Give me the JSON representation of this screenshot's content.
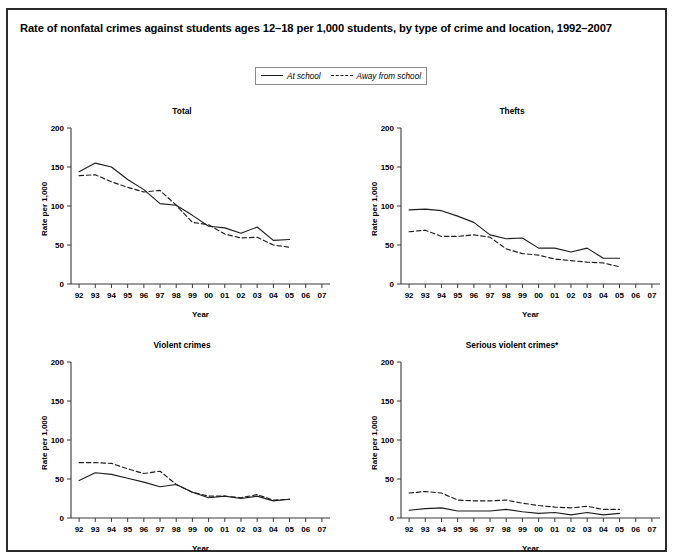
{
  "top_stub": "",
  "figure": {
    "title": "Rate of nonfatal crimes against students ages 12–18 per 1,000 students, by type of crime and location, 1992–2007",
    "footnote": ""
  },
  "legend": {
    "entries": [
      {
        "label": "At school",
        "style": "solid",
        "swatch_name": "solid-line-swatch"
      },
      {
        "label": "Away from school",
        "style": "dashed",
        "swatch_name": "dashed-line-swatch"
      }
    ]
  },
  "axes_common": {
    "ylabel": "Rate per 1,000",
    "xlabel": "Year",
    "yticks": [
      0,
      50,
      100,
      150,
      200
    ],
    "ylim": [
      0,
      200
    ],
    "xticks": [
      "92",
      "93",
      "94",
      "95",
      "96",
      "97",
      "98",
      "99",
      "00",
      "01",
      "02",
      "03",
      "04",
      "05",
      "06",
      "07"
    ]
  },
  "chart_data": [
    {
      "type": "line",
      "title": "Total",
      "xlabel": "Year",
      "ylabel": "Rate per 1,000",
      "ylim": [
        0,
        200
      ],
      "yticks": [
        0,
        50,
        100,
        150,
        200
      ],
      "grid": false,
      "legend_position": "top-center-shared",
      "x": [
        "92",
        "93",
        "94",
        "95",
        "96",
        "97",
        "98",
        "99",
        "00",
        "01",
        "02",
        "03",
        "04",
        "05"
      ],
      "series": [
        {
          "name": "At school",
          "style": "solid",
          "values": [
            144,
            155,
            150,
            134,
            121,
            103,
            101,
            88,
            74,
            72,
            65,
            73,
            56,
            57
          ]
        },
        {
          "name": "Away from school",
          "style": "dashed",
          "values": [
            139,
            140,
            131,
            124,
            118,
            120,
            101,
            79,
            76,
            64,
            59,
            60,
            50,
            47
          ]
        }
      ]
    },
    {
      "type": "line",
      "title": "Thefts",
      "xlabel": "Year",
      "ylabel": "Rate per 1,000",
      "ylim": [
        0,
        200
      ],
      "yticks": [
        0,
        50,
        100,
        150,
        200
      ],
      "grid": false,
      "legend_position": "top-center-shared",
      "x": [
        "92",
        "93",
        "94",
        "95",
        "96",
        "97",
        "98",
        "99",
        "00",
        "01",
        "02",
        "03",
        "04",
        "05"
      ],
      "series": [
        {
          "name": "At school",
          "style": "solid",
          "values": [
            95,
            96,
            94,
            87,
            79,
            63,
            58,
            59,
            46,
            46,
            41,
            46,
            33,
            33
          ]
        },
        {
          "name": "Away from school",
          "style": "dashed",
          "values": [
            67,
            69,
            61,
            61,
            63,
            60,
            45,
            39,
            37,
            32,
            30,
            28,
            27,
            22
          ]
        }
      ]
    },
    {
      "type": "line",
      "title": "Violent crimes",
      "xlabel": "Year",
      "ylabel": "Rate per 1,000",
      "ylim": [
        0,
        200
      ],
      "yticks": [
        0,
        50,
        100,
        150,
        200
      ],
      "grid": false,
      "legend_position": "top-center-shared",
      "x": [
        "92",
        "93",
        "94",
        "95",
        "96",
        "97",
        "98",
        "99",
        "00",
        "01",
        "02",
        "03",
        "04",
        "05"
      ],
      "series": [
        {
          "name": "At school",
          "style": "solid",
          "values": [
            48,
            58,
            56,
            51,
            46,
            40,
            43,
            33,
            26,
            28,
            25,
            28,
            22,
            24
          ]
        },
        {
          "name": "Away from school",
          "style": "dashed",
          "values": [
            71,
            71,
            70,
            63,
            57,
            60,
            43,
            33,
            28,
            28,
            26,
            30,
            23,
            24
          ]
        }
      ]
    },
    {
      "type": "line",
      "title": "Serious violent crimes*",
      "xlabel": "Year",
      "ylabel": "Rate per 1,000",
      "ylim": [
        0,
        200
      ],
      "yticks": [
        0,
        50,
        100,
        150,
        200
      ],
      "grid": false,
      "legend_position": "top-center-shared",
      "x": [
        "92",
        "93",
        "94",
        "95",
        "96",
        "97",
        "98",
        "99",
        "00",
        "01",
        "02",
        "03",
        "04",
        "05"
      ],
      "series": [
        {
          "name": "At school",
          "style": "solid",
          "values": [
            10,
            12,
            13,
            9,
            9,
            9,
            11,
            8,
            6,
            7,
            4,
            7,
            4,
            6
          ]
        },
        {
          "name": "Away from school",
          "style": "dashed",
          "values": [
            32,
            34,
            32,
            23,
            22,
            22,
            23,
            19,
            16,
            14,
            13,
            15,
            11,
            11
          ]
        }
      ]
    }
  ],
  "panels_layout": [
    {
      "left": 14,
      "top": 96,
      "width": 320,
      "height": 216
    },
    {
      "left": 344,
      "top": 96,
      "width": 320,
      "height": 216
    },
    {
      "left": 14,
      "top": 330,
      "width": 320,
      "height": 216
    },
    {
      "left": 344,
      "top": 330,
      "width": 320,
      "height": 216
    }
  ]
}
